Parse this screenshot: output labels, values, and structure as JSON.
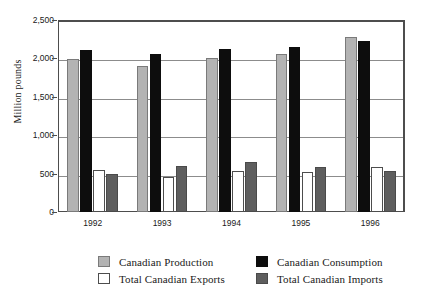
{
  "chart_data": {
    "type": "bar",
    "title": "",
    "subtitle": "",
    "xlabel": "",
    "ylabel": "Million pounds",
    "categories": [
      "1992",
      "1993",
      "1994",
      "1995",
      "1996"
    ],
    "ylim": [
      0,
      2500
    ],
    "ytick_labels": [
      "0",
      "500",
      "1,000",
      "1,500",
      "2,000",
      "2,500"
    ],
    "ytick_values": [
      0,
      500,
      1000,
      1500,
      2000,
      2500
    ],
    "grid": true,
    "legend_position": "bottom",
    "series": [
      {
        "name": "Canadian Production",
        "color": "#b3b3b3",
        "values": [
          1990,
          1900,
          2010,
          2060,
          2280
        ]
      },
      {
        "name": "Canadian Consumption",
        "color": "#0d0d0d",
        "values": [
          2110,
          2060,
          2120,
          2150,
          2230
        ]
      },
      {
        "name": "Total Canadian Exports",
        "color": "#ffffff",
        "values": [
          550,
          450,
          530,
          520,
          590
        ]
      },
      {
        "name": "Total Canadian Imports",
        "color": "#5e5e5e",
        "values": [
          490,
          605,
          645,
          580,
          540
        ]
      }
    ]
  },
  "legend": {
    "items": [
      {
        "label": "Canadian Production",
        "swatch": "production"
      },
      {
        "label": "Canadian Consumption",
        "swatch": "consumption"
      },
      {
        "label": "Total Canadian Exports",
        "swatch": "exports"
      },
      {
        "label": "Total Canadian Imports",
        "swatch": "imports"
      }
    ]
  }
}
